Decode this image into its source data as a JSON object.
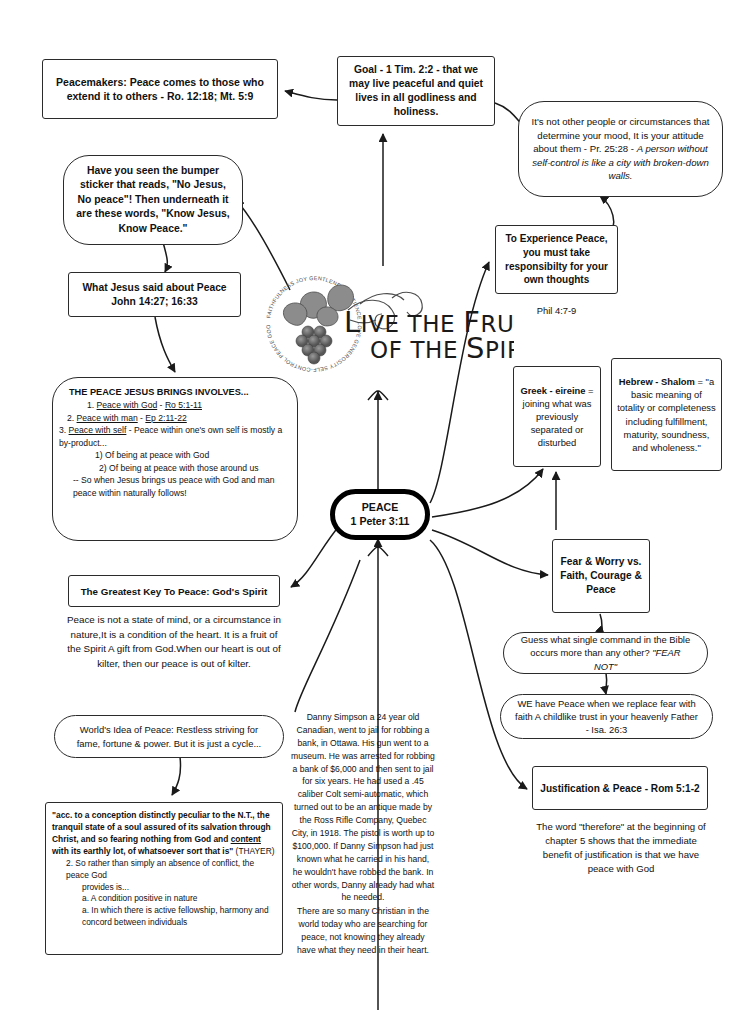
{
  "center": {
    "label": "PEACE",
    "reference": "1 Peter 3:11"
  },
  "logo": {
    "line1": "LIVE THE FRUIT",
    "line2": "OF THE SPIRIT",
    "ring_words": [
      "GENTLENESS",
      "PATIENCE",
      "LOVE",
      "GENEROSITY",
      "SELF-CONTROL",
      "PEACE",
      "GOODNESS",
      "JOY",
      "FAITHFULNESS"
    ]
  },
  "nodes": {
    "peacemakers": "Peacemakers: Peace comes to those who extend it to others - Ro. 12:18; Mt. 5:9",
    "goal_l1": "Goal - 1 Tim. 2:2",
    "goal_l2": " - that we may live peaceful and quiet lives in all godliness and holiness.",
    "attitude_p1": "It's not other people or circumstances that determine your mood, It is your attitude about them - Pr. 25:28 - ",
    "attitude_p2": "A person without self-control is like a city with broken-down walls.",
    "bumper": "Have you seen the bumper sticker that reads, \"No Jesus, No peace\"! Then underneath it are these words, \"Know Jesus, Know Peace.\"",
    "experience": "To Experience Peace, you must take responsibilty for your own thoughts",
    "phil": "Phil 4:7-9",
    "what_jesus_l1": "What Jesus said about Peace",
    "what_jesus_l2": "John 14:27; 16:33",
    "involves": {
      "heading": "THE PEACE JESUS BRINGS INVOLVES...",
      "items": [
        {
          "num": "1. ",
          "topic": "Peace with God",
          "sep": " - ",
          "ref": "Ro 5:1-11",
          "rest": ""
        },
        {
          "num": "2. ",
          "topic": "Peace with man",
          "sep": " - ",
          "ref": "Ep 2:11-22",
          "rest": ""
        },
        {
          "num": "3. ",
          "topic": "Peace with self",
          "sep": "  - ",
          "ref": "",
          "rest": "Peace within one's own self is mostly a by-product..."
        }
      ],
      "sub1": "1) Of being at peace with God",
      "sub2": "2) Of being at peace with those around us",
      "sub3": "-- So when Jesus brings us peace with God and man peace within naturally follows!"
    },
    "greek": {
      "bold": "Greek - eireine",
      "rest": " = joining what was previously separated or disturbed"
    },
    "hebrew": {
      "bold": "Hebrew - Shalom",
      "rest": " = \"a basic meaning of totality or completeness including fulfillment, maturity, soundness, and wholeness.\""
    },
    "fear_worry": "Fear & Worry vs. Faith, Courage & Peace",
    "guess_p1": "Guess what single command in the Bible occurs more than any other? ",
    "guess_p2": "\"FEAR NOT\"",
    "we_have_peace": "WE have Peace when we replace fear with faith A childlike trust in your heavenly Father - Isa. 26:3",
    "justification": "Justification & Peace - Rom 5:1-2",
    "therefore": "The word \"therefore\" at the beginning of chapter 5 shows that the immediate benefit of justification is that we have peace with God",
    "greatest_key": "The Greatest Key To Peace: God's Spirit",
    "not_state": "Peace is not a state of mind, or a circumstance in nature,It is a condition of the heart. It is a fruit of the Spirit A gift from God.When our heart is out of kilter, then our peace is out of kilter.",
    "worlds_idea": "World's Idea of Peace: Restless striving for fame, fortune & power. But it is just a cycle...",
    "thayer": {
      "quote_bold_a": "\"acc. to a conception distinctly peculiar to the N.T., the tranquil state of a soul assured of its salvation through Christ, and so fearing nothing from God and ",
      "quote_bold_underline": "content",
      "quote_bold_b": " with its earthly lot, of whatsoever sort that is\"",
      "attrib": " (THAYER)",
      "line2": "2. So rather than simply an absence of conflict, the peace God",
      "line3": "provides is...",
      "line4": "a. A condition positive in nature",
      "line5": "a. In which there is active fellowship, harmony and concord between individuals"
    },
    "danny": "Danny Simpson a 24 year old Canadian, went to jail for robbing a bank, in Ottawa. His gun went to a museum. He was arrested for robbing a bank of $6,000 and then sent to jail for six years. He had used a .45 caliber Colt semi-automatic, which turned out to be an antique made by the Ross Rifle Company, Quebec City, in 1918. The pistol is worth up to $100,000. If Danny Simpson had just known what he carried in his hand, he wouldn't have robbed the bank. In other words, Danny already had what he needed.",
    "danny2": "There are so many Christian in the world today who are searching for peace, not knowing they already have what they need in their heart."
  },
  "colors": {
    "stroke": "#2b2b2b",
    "core_stroke": "#000000",
    "text": "#111111",
    "background": "#ffffff"
  }
}
